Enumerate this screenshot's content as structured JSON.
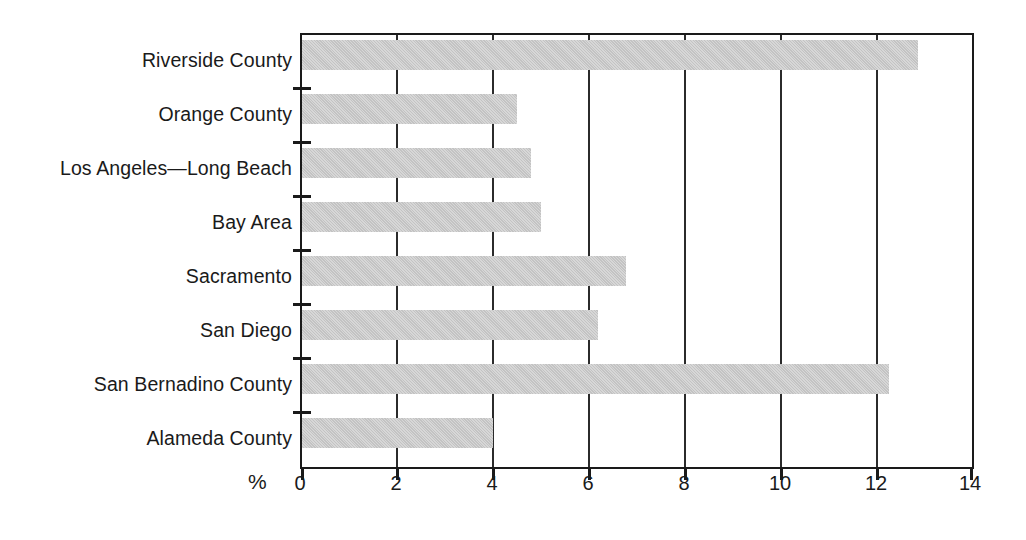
{
  "chart_data": {
    "type": "bar",
    "orientation": "horizontal",
    "title": "",
    "xlabel": "%",
    "ylabel": "",
    "xlim": [
      0,
      14
    ],
    "ylim": null,
    "grid": "vertical",
    "legend": null,
    "bar_color": "#c3c3c3",
    "axis_color": "#1a1a1a",
    "xticks": [
      0,
      2,
      4,
      6,
      8,
      10,
      12,
      14
    ],
    "xticklabels": [
      "0",
      "2",
      "4",
      "6",
      "8",
      "10",
      "12",
      "14"
    ],
    "categories": [
      "Riverside County",
      "Orange County",
      "Los Angeles—Long Beach",
      "Bay Area",
      "Sacramento",
      "San Diego",
      "San Bernadino County",
      "Alameda County"
    ],
    "values": [
      12.9,
      4.5,
      4.8,
      5.0,
      6.8,
      6.2,
      12.3,
      4.0
    ],
    "series": [
      {
        "name": "",
        "values": [
          12.9,
          4.5,
          4.8,
          5.0,
          6.8,
          6.2,
          12.3,
          4.0
        ]
      }
    ]
  }
}
